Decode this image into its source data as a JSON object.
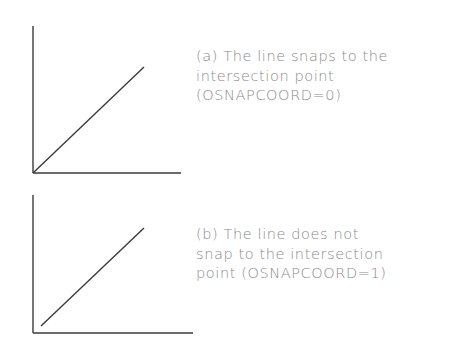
{
  "figures": [
    {
      "id": "a",
      "caption_lines": [
        "(a) The line snaps to the",
        "intersection point",
        "(OSNAPCOORD=0)"
      ],
      "axes": {
        "vertical": [
          33,
          26,
          33,
          173
        ],
        "horizontal": [
          33,
          173,
          181,
          173
        ]
      },
      "line": [
        33,
        173,
        144,
        67
      ]
    },
    {
      "id": "b",
      "caption_lines": [
        "(b) The line does not",
        "snap to the intersection",
        "point (OSNAPCOORD=1)"
      ],
      "axes": {
        "vertical": [
          33,
          195,
          33,
          333
        ],
        "horizontal": [
          33,
          333,
          193,
          333
        ]
      },
      "line": [
        41,
        326,
        144,
        228
      ]
    }
  ],
  "colors": {
    "line": "#3a3a3a",
    "text": "#8a8a8a",
    "background": "#ffffff"
  }
}
